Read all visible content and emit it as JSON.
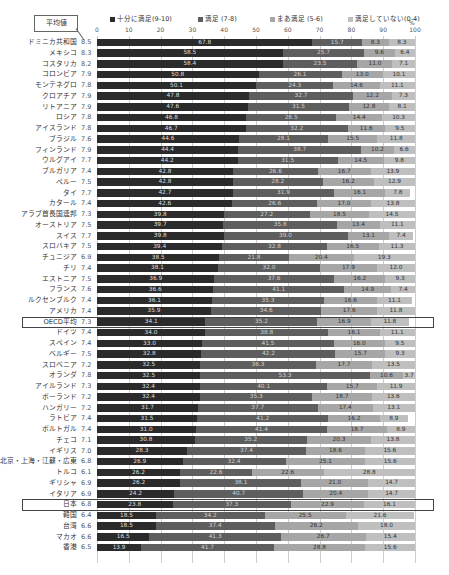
{
  "chart_data": {
    "type": "bar",
    "orientation": "horizontal",
    "stacked": true,
    "title": "",
    "xlabel": "%",
    "ylabel": "",
    "xlim": [
      0,
      100
    ],
    "x_ticks": [
      "0",
      "10",
      "20",
      "30",
      "40",
      "50",
      "60",
      "70",
      "80",
      "90",
      "100"
    ],
    "grid": true,
    "legend_position": "top",
    "annotation": "平均値",
    "highlighted_rows": [
      "OECD平均",
      "日本"
    ],
    "legend": [
      "十分に満足(9-10)",
      "満足 (7-8)",
      "まあ満足 (5-6)",
      "満足していない(0-4)"
    ],
    "categories": [
      "ドミニカ共和国",
      "メキシコ",
      "コスタリカ",
      "コロンビア",
      "モンテネグロ",
      "クロアチア",
      "リトアニア",
      "ロシア",
      "アイスランド",
      "ブラジル",
      "フィンランド",
      "ウルグアイ",
      "ブルガリア",
      "ペルー",
      "タイ",
      "カタール",
      "アラブ首長国連邦",
      "オーストリア",
      "スイス",
      "スロバキア",
      "チュニジア",
      "チリ",
      "エストニア",
      "フランス",
      "ルクセンブルク",
      "アメリカ",
      "OECD平均",
      "ドイツ",
      "スペイン",
      "ベルギー",
      "スロベニア",
      "オランダ",
      "アイルランド",
      "ポーランド",
      "ハンガリー",
      "ラトビア",
      "ポルトガル",
      "チェコ",
      "イギリス",
      "北京・上海・江蘇・広東",
      "トルコ",
      "ギリシャ",
      "イタリア",
      "日本",
      "韓国",
      "台湾",
      "マカオ",
      "香港"
    ],
    "averages": [
      "8.5",
      "8.3",
      "8.2",
      "7.9",
      "7.8",
      "7.9",
      "7.9",
      "7.8",
      "7.8",
      "7.6",
      "7.9",
      "7.7",
      "7.4",
      "7.5",
      "7.7",
      "7.4",
      "7.3",
      "7.5",
      "7.7",
      "7.5",
      "6.9",
      "7.4",
      "7.5",
      "7.6",
      "7.4",
      "7.4",
      "7.3",
      "7.4",
      "7.4",
      "7.5",
      "7.2",
      "7.8",
      "7.3",
      "7.2",
      "7.2",
      "7.4",
      "7.4",
      "7.1",
      "7.0",
      "6.8",
      "6.1",
      "6.9",
      "6.9",
      "6.8",
      "6.4",
      "6.6",
      "6.6",
      "6.5"
    ],
    "series": [
      {
        "name": "十分に満足(9-10)",
        "color": "#2b2b2b",
        "values": [
          67.8,
          58.5,
          58.4,
          50.8,
          50.1,
          47.8,
          47.6,
          46.8,
          46.7,
          44.6,
          44.4,
          44.2,
          42.8,
          42.8,
          42.7,
          42.6,
          39.8,
          39.7,
          39.8,
          39.4,
          38.5,
          38.1,
          36.9,
          36.6,
          36.1,
          35.9,
          34.1,
          34.0,
          33.0,
          32.8,
          32.5,
          32.5,
          32.4,
          32.4,
          31.7,
          31.5,
          31.0,
          30.8,
          28.3,
          26.9,
          26.2,
          26.2,
          24.2,
          23.8,
          18.5,
          18.5,
          16.5,
          13.9
        ]
      },
      {
        "name": "満足 (7-8)",
        "color": "#5e5e5e",
        "values": [
          15.7,
          25.7,
          23.5,
          26.1,
          24.3,
          32.7,
          31.5,
          28.5,
          32.2,
          28.1,
          38.7,
          31.5,
          26.6,
          28.2,
          31.9,
          26.6,
          27.2,
          35.8,
          39.0,
          32.8,
          21.8,
          32.0,
          37.6,
          41.1,
          35.3,
          34.6,
          35.2,
          38.8,
          41.5,
          42.2,
          36.3,
          53.3,
          40.1,
          35.3,
          37.7,
          41.2,
          41.4,
          35.2,
          37.4,
          32.4,
          22.6,
          38.1,
          40.7,
          37.3,
          34.2,
          37.4,
          41.3,
          41.7
        ]
      },
      {
        "name": "まあ満足 (5-6)",
        "color": "#a6a6a6",
        "values": [
          8.3,
          9.6,
          11.0,
          13.0,
          14.6,
          12.2,
          12.8,
          14.4,
          11.6,
          15.5,
          10.2,
          14.5,
          16.7,
          16.2,
          16.1,
          17.0,
          18.5,
          13.4,
          13.1,
          16.5,
          20.4,
          17.9,
          16.2,
          14.9,
          16.6,
          17.6,
          16.9,
          16.1,
          16.0,
          15.7,
          17.7,
          10.6,
          15.7,
          18.7,
          17.4,
          16.2,
          18.7,
          20.3,
          18.6,
          25.1,
          22.6,
          21.0,
          20.4,
          22.9,
          25.5,
          26.2,
          26.7,
          28.8
        ]
      },
      {
        "name": "満足していない(0-4)",
        "color": "#bfbfbf",
        "values": [
          8.3,
          6.4,
          7.1,
          10.1,
          11.1,
          7.3,
          8.1,
          10.3,
          9.5,
          11.8,
          6.6,
          9.8,
          13.9,
          12.9,
          7.8,
          13.8,
          14.5,
          11.1,
          7.4,
          11.3,
          19.3,
          12.0,
          9.3,
          7.4,
          11.1,
          11.8,
          11.8,
          11.1,
          9.5,
          9.3,
          13.5,
          3.7,
          11.9,
          13.6,
          13.1,
          8.9,
          8.9,
          13.8,
          15.6,
          15.6,
          28.8,
          14.7,
          14.7,
          16.1,
          21.6,
          18.0,
          15.4,
          15.6
        ]
      }
    ]
  },
  "labels": {
    "avg_box": "平均値",
    "pct_unit": "%",
    "legend": [
      "十分に満足(9-10)",
      "満足 (7-8)",
      "まあ満足 (5-6)",
      "満足していない(0-4)"
    ]
  }
}
